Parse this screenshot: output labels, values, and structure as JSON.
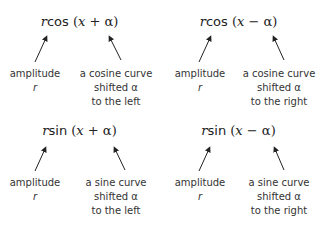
{
  "blocks": [
    {
      "id": "rcos-plus",
      "formula": {
        "coef": "r",
        "fn": "cos",
        "open": " (",
        "var": "x",
        "op": " + ",
        "shift": "α",
        "close": ")"
      },
      "left_label": {
        "line1": "amplitude",
        "line2": "r"
      },
      "right_label": {
        "line1": "a cosine curve",
        "line2": "shifted α",
        "line3": "to the left"
      }
    },
    {
      "id": "rcos-minus",
      "formula": {
        "coef": "r",
        "fn": "cos",
        "open": " (",
        "var": "x",
        "op": " − ",
        "shift": "α",
        "close": ")"
      },
      "left_label": {
        "line1": "amplitude",
        "line2": "r"
      },
      "right_label": {
        "line1": "a cosine curve",
        "line2": "shifted α",
        "line3": "to the right"
      }
    },
    {
      "id": "rsin-plus",
      "formula": {
        "coef": "r",
        "fn": "sin",
        "open": " (",
        "var": "x",
        "op": " + ",
        "shift": "α",
        "close": ")"
      },
      "left_label": {
        "line1": "amplitude",
        "line2": "r"
      },
      "right_label": {
        "line1": "a sine curve",
        "line2": "shifted α",
        "line3": "to the left"
      }
    },
    {
      "id": "rsin-minus",
      "formula": {
        "coef": "r",
        "fn": "sin",
        "open": " (",
        "var": "x",
        "op": " − ",
        "shift": "α",
        "close": ")"
      },
      "left_label": {
        "line1": "amplitude",
        "line2": "r"
      },
      "right_label": {
        "line1": "a sine curve",
        "line2": "shifted α",
        "line3": "to the right"
      }
    }
  ]
}
